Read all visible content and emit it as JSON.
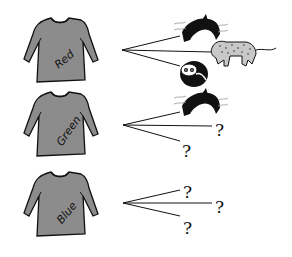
{
  "diagram": {
    "title": "",
    "colors": {
      "shirt_fill": "#8c8c8c",
      "outline": "#111111",
      "background": "#ffffff"
    },
    "rows": [
      {
        "shirt_label": "Red",
        "branches": [
          {
            "target": "dolphin-icon"
          },
          {
            "target": "leopard-icon"
          },
          {
            "target": "panda-icon"
          }
        ]
      },
      {
        "shirt_label": "Green",
        "branches": [
          {
            "target": "dolphin-icon"
          },
          {
            "target": "?"
          },
          {
            "target": "?"
          }
        ]
      },
      {
        "shirt_label": "Blue",
        "branches": [
          {
            "target": "?"
          },
          {
            "target": "?"
          },
          {
            "target": "?"
          }
        ]
      }
    ]
  }
}
